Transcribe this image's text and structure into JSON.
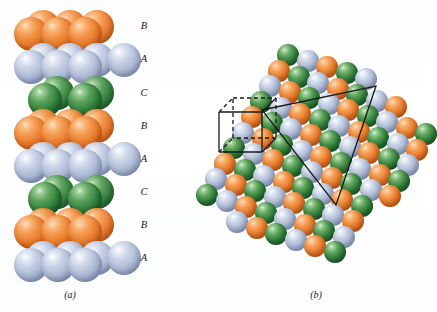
{
  "figure": {
    "background_color": "#ffffff",
    "panels": [
      {
        "id": "a",
        "caption": "(a)"
      },
      {
        "id": "b",
        "caption": "(b)"
      }
    ]
  },
  "colors": {
    "layer_A": "#aab7d2",
    "layer_B": "#e87a2c",
    "layer_C": "#2f7d3a",
    "outline": "#1a1a1a",
    "background": "#ffffff"
  },
  "panel_a": {
    "caption": "(a)",
    "description": "Vertical stack of close-packed sphere layers",
    "stacking_sequence": [
      "B",
      "A",
      "C",
      "B",
      "A",
      "C",
      "B",
      "A"
    ],
    "layers": [
      {
        "label": "B",
        "color_key": "layer_B",
        "color": "#e87a2c",
        "top": 10,
        "label_y": 21,
        "back_count": 3,
        "front_count": 3,
        "narrow": false
      },
      {
        "label": "A",
        "color_key": "layer_A",
        "color": "#aab7d2",
        "top": 43,
        "label_y": 54,
        "back_count": 4,
        "front_count": 3,
        "narrow": false
      },
      {
        "label": "C",
        "color_key": "layer_C",
        "color": "#2f7d3a",
        "top": 76,
        "label_y": 88,
        "back_count": 2,
        "front_count": 2,
        "narrow": true
      },
      {
        "label": "B",
        "color_key": "layer_B",
        "color": "#e87a2c",
        "top": 109,
        "label_y": 121,
        "back_count": 3,
        "front_count": 3,
        "narrow": false
      },
      {
        "label": "A",
        "color_key": "layer_A",
        "color": "#aab7d2",
        "top": 142,
        "label_y": 154,
        "back_count": 4,
        "front_count": 3,
        "narrow": false
      },
      {
        "label": "C",
        "color_key": "layer_C",
        "color": "#2f7d3a",
        "top": 175,
        "label_y": 187,
        "back_count": 2,
        "front_count": 2,
        "narrow": true
      },
      {
        "label": "B",
        "color_key": "layer_B",
        "color": "#e87a2c",
        "top": 208,
        "label_y": 220,
        "back_count": 3,
        "front_count": 3,
        "narrow": false
      },
      {
        "label": "A",
        "color_key": "layer_A",
        "color": "#aab7d2",
        "top": 241,
        "label_y": 253,
        "back_count": 4,
        "front_count": 3,
        "narrow": false
      }
    ],
    "sphere_diameter": 34,
    "label_x": 136
  },
  "panel_b": {
    "caption": "(b)",
    "description": "Three-dimensional close-packed cluster with cubic unit cell and close-packed plane triangle",
    "sphere_diameter": 22,
    "row_count": 11,
    "color_cycle": [
      "layer_C",
      "layer_A",
      "layer_B"
    ],
    "unit_cell": {
      "name": "cubic-unit-cell",
      "front_face": {
        "x": 219,
        "y": 112,
        "width": 43,
        "height": 40
      },
      "depth_dx": 14,
      "depth_dy": -14,
      "solid_edges": "front square and two front-to-back connectors",
      "dashed_edges": "hidden back edges"
    },
    "close_packed_triangle": {
      "name": "close-packed-plane-triangle",
      "vertices": [
        [
          262,
          110
        ],
        [
          376,
          86
        ],
        [
          336,
          205
        ]
      ]
    }
  }
}
